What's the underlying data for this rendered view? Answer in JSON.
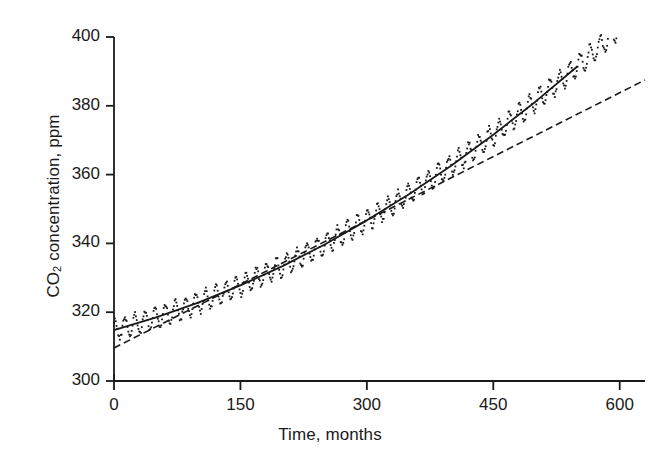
{
  "figure": {
    "background_color": "#ffffff",
    "ink_color": "#1a1a1a"
  },
  "axes": {
    "y_title_prefix": "CO",
    "y_title_sub": "2",
    "y_title_suffix": " concentration, ppm",
    "y_title_full": "CO2 concentration, ppm",
    "x_title": "Time, months",
    "y_ticks": [
      "400",
      "380",
      "360",
      "340",
      "320",
      "300"
    ],
    "x_ticks": [
      "0",
      "150",
      "300",
      "450",
      "600"
    ]
  },
  "chart_data": {
    "type": "scatter",
    "title": "",
    "subtitle": "",
    "xlabel": "Time, months",
    "ylabel": "CO2 concentration, ppm",
    "xlim": [
      0,
      630
    ],
    "ylim": [
      300,
      400
    ],
    "xticks": [
      0,
      150,
      300,
      450,
      600
    ],
    "yticks": [
      300,
      320,
      340,
      360,
      380,
      400
    ],
    "grid": false,
    "legend": "none",
    "axis_style": "left-and-bottom-spines-only",
    "series": [
      {
        "name": "Monthly CO2 observations",
        "type": "scatter",
        "marker": "small-dot",
        "description": "Monthly mean atmospheric CO2 with seasonal oscillation of about plus or minus 3 ppm superimposed on a rising trend",
        "seasonal_amplitude_ppm": 3.0,
        "seasonal_period_months": 12,
        "noise_ppm": 0.6,
        "x_start": 0,
        "x_end": 630,
        "n_points": 631,
        "trend_model": "quadratic",
        "trend_coefficients": {
          "a0": 314.8,
          "a1": 0.0665,
          "a2": 0.000133
        }
      },
      {
        "name": "Quadratic trend fit",
        "type": "line",
        "style": "solid",
        "width": 1.8,
        "description": "Smooth fitted quadratic curve through the monthly data",
        "points": [
          {
            "x": 0,
            "y": 314.8
          },
          {
            "x": 50,
            "y": 318.5
          },
          {
            "x": 100,
            "y": 322.8
          },
          {
            "x": 150,
            "y": 327.8
          },
          {
            "x": 200,
            "y": 333.4
          },
          {
            "x": 250,
            "y": 339.7
          },
          {
            "x": 300,
            "y": 346.7
          },
          {
            "x": 350,
            "y": 354.3
          },
          {
            "x": 400,
            "y": 362.6
          },
          {
            "x": 450,
            "y": 371.6
          },
          {
            "x": 500,
            "y": 381.2
          },
          {
            "x": 550,
            "y": 391.5
          },
          {
            "x": 600,
            "y": 402.5
          },
          {
            "x": 630,
            "y": 409.5
          }
        ]
      },
      {
        "name": "Linear trend fit",
        "type": "line",
        "style": "dashed",
        "width": 1.6,
        "dash_pattern": "7,4",
        "description": "Straight dashed least squares line starting below the data near 310 ppm and crossing above the curve at the right edge",
        "points": [
          {
            "x": 0,
            "y": 309.6
          },
          {
            "x": 630,
            "y": 387.5
          }
        ]
      }
    ]
  }
}
